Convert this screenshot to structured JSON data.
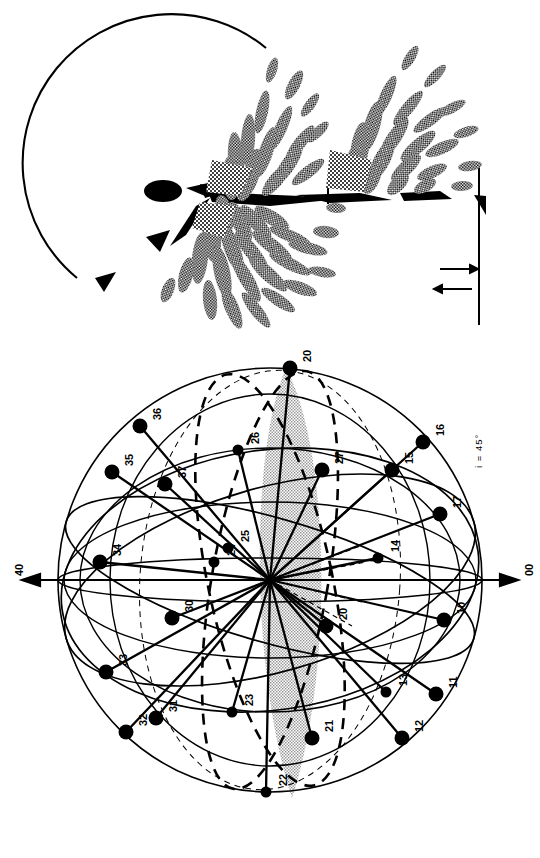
{
  "figure": {
    "orientation": "rotated-90-ccw",
    "background_color": "#ffffff",
    "ink_color": "#000000",
    "halftone_color": "#6e6e6e",
    "shaded_lobe_color": "#c8c8c8"
  },
  "panels": [
    {
      "id": "field-pattern",
      "name": "vector-field-pattern",
      "description_visible": "",
      "has_arc": true,
      "arrow_legend": {
        "arrow_right": "→",
        "arrow_left": "←"
      }
    },
    {
      "id": "sphere-diagram",
      "name": "labelled-sphere-diagram",
      "annotation": "i = 45°"
    }
  ],
  "sphere": {
    "axis_labels": {
      "left_end": "40",
      "right_end": "00"
    },
    "annotation": "i = 45°",
    "nodes": [
      {
        "label": "20",
        "x": 290,
        "y": 28,
        "lx": 302,
        "ly": 22,
        "big": true
      },
      {
        "label": "36",
        "x": 140,
        "y": 86,
        "lx": 152,
        "ly": 80,
        "big": true
      },
      {
        "label": "16",
        "x": 423,
        "y": 102,
        "lx": 435,
        "ly": 96,
        "big": true
      },
      {
        "label": "26",
        "x": 238,
        "y": 110,
        "lx": 250,
        "ly": 104,
        "big": false
      },
      {
        "label": "35",
        "x": 112,
        "y": 132,
        "lx": 124,
        "ly": 126,
        "big": true
      },
      {
        "label": "37",
        "x": 165,
        "y": 144,
        "lx": 177,
        "ly": 138,
        "big": true
      },
      {
        "label": "15",
        "x": 392,
        "y": 130,
        "lx": 404,
        "ly": 124,
        "big": true
      },
      {
        "label": "27",
        "x": 322,
        "y": 130,
        "lx": 334,
        "ly": 124,
        "big": true
      },
      {
        "label": "17",
        "x": 440,
        "y": 174,
        "lx": 452,
        "ly": 168,
        "big": true
      },
      {
        "label": "34",
        "x": 100,
        "y": 222,
        "lx": 112,
        "ly": 216,
        "big": true
      },
      {
        "label": "14",
        "x": 378,
        "y": 218,
        "lx": 390,
        "ly": 212,
        "big": false
      },
      {
        "label": "25",
        "x": 228,
        "y": 208,
        "lx": 240,
        "ly": 202,
        "big": false
      },
      {
        "label": "24",
        "x": 214,
        "y": 222,
        "lx": 226,
        "ly": 216,
        "big": false
      },
      {
        "label": "30",
        "x": 172,
        "y": 278,
        "lx": 184,
        "ly": 272,
        "big": true
      },
      {
        "label": "10",
        "x": 444,
        "y": 280,
        "lx": 456,
        "ly": 274,
        "big": true
      },
      {
        "label": "20",
        "x": 326,
        "y": 286,
        "lx": 338,
        "ly": 280,
        "big": true
      },
      {
        "label": "33",
        "x": 106,
        "y": 332,
        "lx": 118,
        "ly": 326,
        "big": true
      },
      {
        "label": "13",
        "x": 386,
        "y": 352,
        "lx": 398,
        "ly": 346,
        "big": false
      },
      {
        "label": "11",
        "x": 436,
        "y": 354,
        "lx": 448,
        "ly": 348,
        "big": true
      },
      {
        "label": "31",
        "x": 156,
        "y": 378,
        "lx": 168,
        "ly": 372,
        "big": true
      },
      {
        "label": "32",
        "x": 126,
        "y": 392,
        "lx": 138,
        "ly": 386,
        "big": true
      },
      {
        "label": "23",
        "x": 232,
        "y": 372,
        "lx": 244,
        "ly": 366,
        "big": false
      },
      {
        "label": "21",
        "x": 312,
        "y": 398,
        "lx": 324,
        "ly": 392,
        "big": true
      },
      {
        "label": "12",
        "x": 402,
        "y": 398,
        "lx": 414,
        "ly": 392,
        "big": true
      },
      {
        "label": "22",
        "x": 266,
        "y": 452,
        "lx": 278,
        "ly": 446,
        "big": false
      }
    ]
  }
}
